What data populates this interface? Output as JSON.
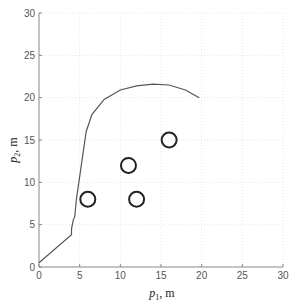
{
  "chart_data": {
    "type": "line",
    "title": "",
    "xlabel": "p1, m",
    "ylabel": "p2, m",
    "xlabel_parts": {
      "symbol": "p",
      "sub": "1",
      "unit": ", m"
    },
    "ylabel_parts": {
      "symbol": "p",
      "sub": "2",
      "unit": ", m"
    },
    "xlim": [
      0,
      30
    ],
    "ylim": [
      0,
      30
    ],
    "xticks": [
      0,
      5,
      10,
      15,
      20,
      25,
      30
    ],
    "yticks": [
      0,
      5,
      10,
      15,
      20,
      25,
      30
    ],
    "grid": true,
    "legend": null,
    "series": [
      {
        "name": "trajectory",
        "style": "line",
        "color": "#555555",
        "x": [
          0,
          4,
          4,
          4.2,
          4.4,
          4.6,
          5.2,
          5.8,
          6.5,
          8,
          10,
          12,
          14,
          16,
          18,
          19.7
        ],
        "y": [
          0.5,
          3.8,
          4.5,
          5.5,
          6,
          8,
          12,
          16,
          18,
          19.8,
          20.9,
          21.4,
          21.6,
          21.5,
          20.9,
          20.0
        ]
      },
      {
        "name": "obstacles",
        "style": "circle-markers",
        "color": "#222222",
        "x": [
          6,
          12,
          11,
          16
        ],
        "y": [
          8,
          8,
          12,
          15
        ]
      }
    ]
  },
  "colors": {
    "axis": "#888888",
    "grid": "#e6e6e6",
    "line": "#555555",
    "marker": "#222222"
  }
}
